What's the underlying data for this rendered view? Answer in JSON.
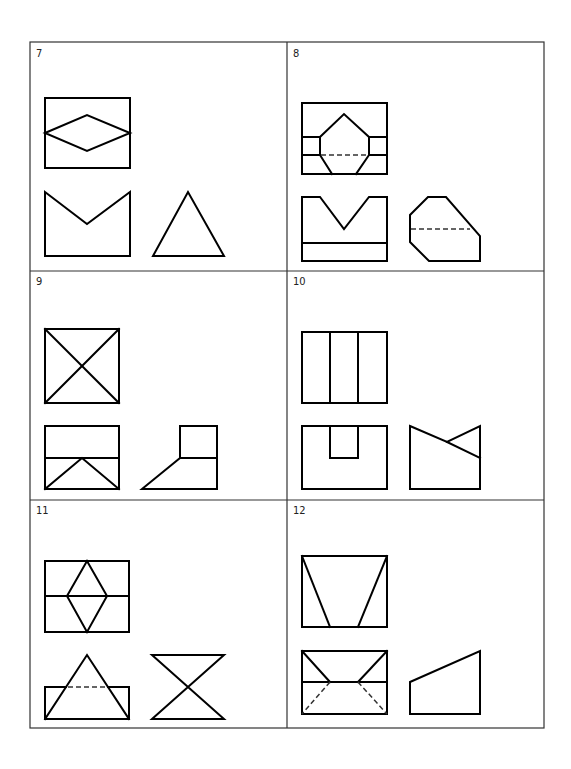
{
  "sheet": {
    "layout": "3 rows x 2 columns grid of exercise panels",
    "frame_color": "#333333",
    "line_color": "#000000"
  },
  "panels": [
    {
      "number": "7",
      "views": [
        "top",
        "front",
        "side"
      ],
      "description": "Rectangle with horizontal diamond; V-notched front; triangle side"
    },
    {
      "number": "8",
      "views": [
        "top",
        "front",
        "side"
      ],
      "description": "Rectangle with chamfered pentagon and hidden line; V-notched front with base line; chamfered side with hidden line"
    },
    {
      "number": "9",
      "views": [
        "top",
        "front",
        "side"
      ],
      "description": "Square with diagonals; front with inverted V; L-shaped side with slope"
    },
    {
      "number": "10",
      "views": [
        "top",
        "front",
        "side"
      ],
      "description": "Rectangle divided in three; U-notched front; side with V cut"
    },
    {
      "number": "11",
      "views": [
        "top",
        "front",
        "side"
      ],
      "description": "Rectangle with vertical diamond; triangle over rectangle with hidden line; bow-tie side"
    },
    {
      "number": "12",
      "views": [
        "top",
        "front",
        "side"
      ],
      "description": "Trapezoid lines in rectangle; front with solid and hidden diagonals; sloped side"
    }
  ]
}
